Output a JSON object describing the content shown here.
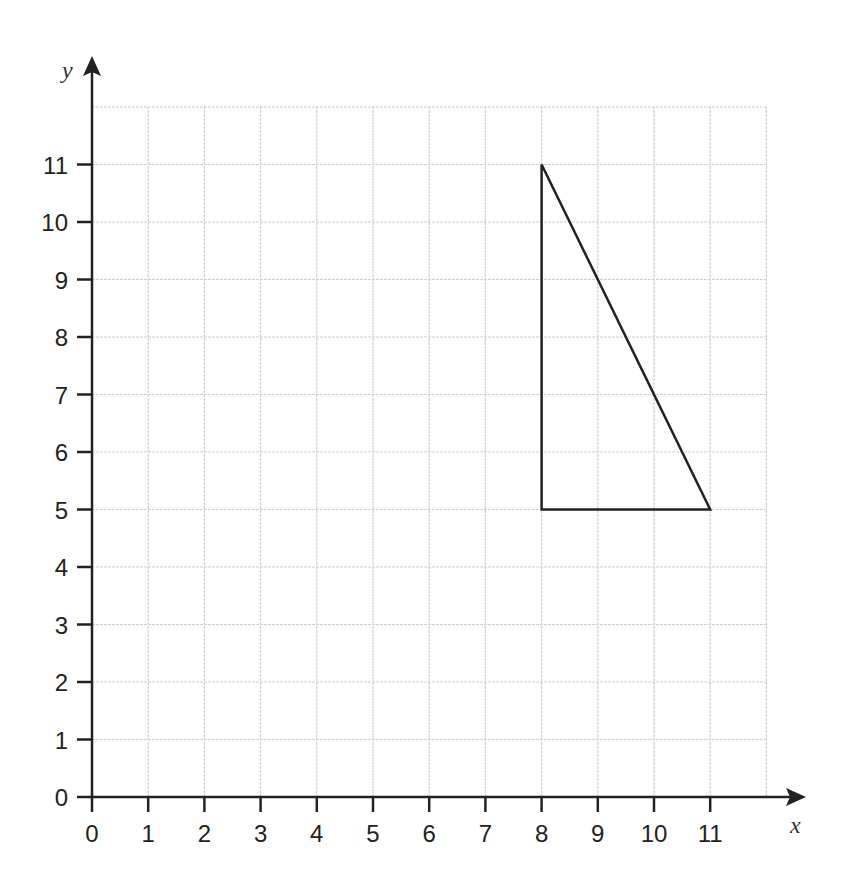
{
  "chart_data": {
    "type": "scatter",
    "title": "",
    "xlabel": "x",
    "ylabel": "y",
    "xlim": [
      0,
      12
    ],
    "ylim": [
      0,
      12
    ],
    "grid": true,
    "x_ticks": [
      "0",
      "1",
      "2",
      "3",
      "4",
      "5",
      "6",
      "7",
      "8",
      "9",
      "10",
      "11"
    ],
    "y_ticks": [
      "0",
      "1",
      "2",
      "3",
      "4",
      "5",
      "6",
      "7",
      "8",
      "9",
      "10",
      "11"
    ],
    "shapes": [
      {
        "name": "triangle",
        "type": "polygon",
        "vertices": [
          [
            8,
            11
          ],
          [
            8,
            5
          ],
          [
            11,
            5
          ]
        ],
        "stroke": "#222222",
        "fill": "none"
      }
    ]
  },
  "colors": {
    "axis": "#222222",
    "grid": "#cfcfcf",
    "shape": "#222222"
  }
}
